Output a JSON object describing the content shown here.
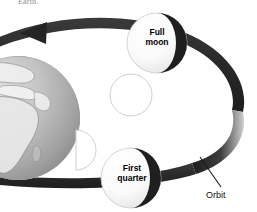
{
  "figure": {
    "title_fragment": "Earth.",
    "background_color": "#ffffff",
    "orbit_band_color": "#2b2b2b",
    "moon_lit_color": "#fdfdfd",
    "moon_dark_color": "#1f1f1f",
    "earth_color": "#b9b9b9",
    "outline_color": "#cfcfcf",
    "label_color": "#000000"
  },
  "labels": {
    "full_moon": "Full\nmoon",
    "first_quarter": "First\nquarter",
    "orbit": "Orbit"
  },
  "bodies": [
    {
      "name": "earth",
      "label": "",
      "kind": "planet",
      "cx": 18,
      "cy": 118,
      "r": 62
    },
    {
      "name": "full-moon",
      "label": "Full moon",
      "kind": "moon-phase",
      "cx": 157,
      "cy": 43,
      "r": 30
    },
    {
      "name": "first-quarter-moon",
      "label": "First quarter",
      "kind": "moon-phase",
      "cx": 131,
      "cy": 178,
      "r": 30
    },
    {
      "name": "new-moon-position",
      "label": "",
      "kind": "moon-outline",
      "cx": 131,
      "cy": 95,
      "r": 21
    },
    {
      "name": "first-quarter-appearance",
      "label": "",
      "kind": "half-moon-outline",
      "cx": 79,
      "cy": 150,
      "r": 20
    }
  ],
  "annotations": [
    {
      "name": "orbit-direction-arrow",
      "direction": "left",
      "x": 33,
      "y": 33
    },
    {
      "name": "orbit-leader-line",
      "from_x": 200,
      "from_y": 157,
      "to_x": 221,
      "to_y": 187
    }
  ]
}
